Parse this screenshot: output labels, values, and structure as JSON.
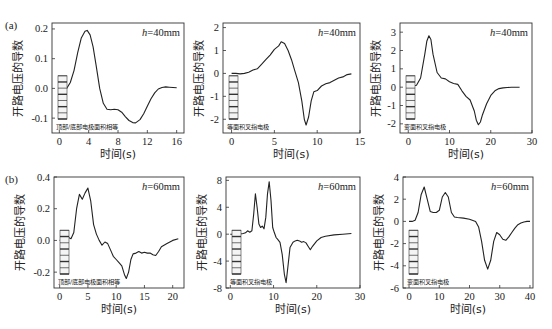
{
  "figure": {
    "row_labels": [
      "(a)",
      "(b)"
    ],
    "ylabel": "开路电压的导数",
    "xlabel": "时间(s)",
    "line_color": "#222222",
    "axis_color": "#333333"
  },
  "chart_data": [
    {
      "type": "line",
      "row": "(a)",
      "annotation": "h=40mm",
      "inset_label": "顶部/底部电极面积相等",
      "xlabel": "时间(s)",
      "ylabel": "开路电压的导数",
      "xlim": [
        -1,
        17
      ],
      "ylim": [
        -0.15,
        0.22
      ],
      "xticks": [
        0,
        4,
        8,
        12,
        16
      ],
      "yticks": [
        -0.1,
        0.0,
        0.1,
        0.2
      ],
      "ytick_labels": [
        "-0.1",
        "0.0",
        "0.1",
        "0.2"
      ],
      "box": [
        52,
        23,
        184,
        133
      ],
      "x": [
        0,
        0.5,
        1,
        1.5,
        2,
        2.5,
        3,
        3.5,
        3.8,
        4.2,
        4.6,
        5,
        5.5,
        6,
        6.5,
        7,
        7.5,
        8,
        8.5,
        9,
        9.5,
        10,
        10.4,
        11,
        11.5,
        12,
        12.5,
        13,
        13.5,
        14,
        14.5,
        15,
        15.5,
        16
      ],
      "y": [
        -0.005,
        -0.005,
        0.0,
        0.02,
        0.06,
        0.12,
        0.17,
        0.192,
        0.195,
        0.18,
        0.14,
        0.08,
        0.0,
        -0.05,
        -0.07,
        -0.072,
        -0.07,
        -0.072,
        -0.08,
        -0.095,
        -0.108,
        -0.115,
        -0.116,
        -0.105,
        -0.085,
        -0.06,
        -0.035,
        -0.015,
        -0.002,
        0.003,
        0.005,
        0.004,
        0.003,
        0.002
      ]
    },
    {
      "type": "line",
      "row": "(a)",
      "annotation": "h=40mm",
      "inset_label": "等面积叉指电极",
      "xlabel": "时间(s)",
      "ylabel": "开路电压的导数",
      "xlim": [
        -1,
        15
      ],
      "ylim": [
        -2.6,
        2.2
      ],
      "xticks": [
        0,
        5,
        10,
        15
      ],
      "yticks": [
        -2,
        -1,
        0,
        1,
        2
      ],
      "ytick_labels": [
        "-2",
        "-1",
        "0",
        "1",
        "2"
      ],
      "box": [
        223,
        23,
        360,
        133
      ],
      "x": [
        0,
        0.5,
        1,
        1.5,
        2,
        2.5,
        3,
        3.5,
        4,
        4.5,
        5,
        5.5,
        5.8,
        6.2,
        6.6,
        7,
        7.4,
        7.8,
        8.2,
        8.5,
        8.7,
        9,
        9.3,
        9.6,
        10,
        10.5,
        11,
        11.5,
        12,
        12.5,
        13,
        13.5,
        14
      ],
      "y": [
        0.0,
        0.0,
        -0.02,
        0.0,
        0.05,
        0.15,
        0.2,
        0.4,
        0.6,
        0.8,
        1.05,
        1.2,
        1.38,
        1.3,
        1.0,
        0.6,
        0.1,
        -0.4,
        -1.2,
        -2.0,
        -2.25,
        -1.9,
        -1.2,
        -0.8,
        -0.75,
        -0.55,
        -0.45,
        -0.4,
        -0.3,
        -0.2,
        -0.15,
        -0.05,
        -0.02
      ]
    },
    {
      "type": "line",
      "row": "(a)",
      "annotation": "h=40mm",
      "inset_label": "变面积叉指电极",
      "xlabel": "时间(s)",
      "ylabel": "开路电压的导数",
      "xlim": [
        -2,
        30
      ],
      "ylim": [
        -2.5,
        3.5
      ],
      "xticks": [
        0,
        10,
        20,
        30
      ],
      "yticks": [
        -2,
        -1,
        0,
        1,
        2,
        3
      ],
      "ytick_labels": [
        "-2",
        "-1",
        "0",
        "1",
        "2",
        "3"
      ],
      "box": [
        400,
        23,
        532,
        133
      ],
      "x": [
        0,
        1,
        2,
        3,
        4,
        4.5,
        5,
        5.5,
        6,
        7,
        8,
        9,
        10,
        11,
        12,
        13,
        14,
        15,
        16,
        16.5,
        17,
        17.5,
        18,
        19,
        20,
        21,
        22,
        23,
        24,
        25,
        26,
        27
      ],
      "y": [
        0.0,
        0.05,
        0.1,
        0.5,
        1.8,
        2.5,
        2.8,
        2.6,
        1.8,
        0.8,
        0.5,
        0.45,
        0.3,
        0.2,
        0.15,
        -0.2,
        -0.5,
        -0.7,
        -1.3,
        -1.8,
        -2.05,
        -1.9,
        -1.5,
        -0.9,
        -0.45,
        -0.2,
        -0.08,
        -0.04,
        -0.02,
        -0.01,
        0.0,
        0.0
      ]
    },
    {
      "type": "line",
      "row": "(b)",
      "annotation": "h=60mm",
      "inset_label": "顶部/底部电极面积相等",
      "xlabel": "时间(s)",
      "ylabel": "开路电压的导数",
      "xlim": [
        -1,
        22
      ],
      "ylim": [
        -0.3,
        0.4
      ],
      "xticks": [
        0,
        5,
        10,
        15,
        20
      ],
      "yticks": [
        -0.2,
        0.0,
        0.2,
        0.4
      ],
      "ytick_labels": [
        "-0.2",
        "0.0",
        "0.2",
        "0.4"
      ],
      "box": [
        54,
        177,
        184,
        288
      ],
      "x": [
        0,
        0.5,
        1,
        1.5,
        2,
        2.5,
        3,
        3.5,
        4,
        4.5,
        5,
        5.5,
        6,
        6.5,
        7,
        7.5,
        8,
        8.5,
        9,
        9.5,
        10,
        10.5,
        11,
        11.5,
        11.8,
        12.2,
        12.6,
        13,
        13.5,
        14,
        14.5,
        15,
        15.5,
        16,
        16.5,
        17,
        17.5,
        18,
        19,
        20,
        21
      ],
      "y": [
        0.0,
        0.0,
        0.01,
        0.02,
        0.01,
        0.05,
        0.2,
        0.29,
        0.26,
        0.3,
        0.33,
        0.25,
        0.1,
        0.04,
        0.0,
        -0.03,
        -0.01,
        -0.02,
        -0.06,
        -0.1,
        -0.12,
        -0.14,
        -0.16,
        -0.22,
        -0.24,
        -0.2,
        -0.12,
        -0.085,
        -0.08,
        -0.07,
        -0.08,
        -0.075,
        -0.08,
        -0.08,
        -0.09,
        -0.095,
        -0.07,
        -0.04,
        -0.02,
        0.0,
        0.01
      ]
    },
    {
      "type": "line",
      "row": "(b)",
      "annotation": "h=60mm",
      "inset_label": "等面积叉指电极",
      "xlabel": "时间(s)",
      "ylabel": "开路电压的导数",
      "xlim": [
        -1,
        30
      ],
      "ylim": [
        -8,
        8.5
      ],
      "xticks": [
        0,
        10,
        20,
        30
      ],
      "yticks": [
        -8,
        -4,
        0,
        4,
        8
      ],
      "ytick_labels": [
        "-8",
        "-4",
        "0",
        "4",
        "8"
      ],
      "box": [
        226,
        177,
        360,
        288
      ],
      "x": [
        0,
        1,
        2,
        3,
        3.5,
        4,
        4.5,
        5,
        5.4,
        5.8,
        6.2,
        6.6,
        7,
        7.4,
        7.8,
        8.2,
        8.6,
        9,
        9.4,
        9.8,
        10.2,
        10.6,
        11,
        11.5,
        12,
        12.5,
        12.9,
        13.3,
        13.8,
        14.5,
        15,
        15.5,
        16,
        16.5,
        17,
        17.5,
        18,
        18.5,
        19,
        20,
        21,
        22,
        24,
        26,
        28
      ],
      "y": [
        0.0,
        0.0,
        0.0,
        0.1,
        0.2,
        0.5,
        0.3,
        0.5,
        3.0,
        6.0,
        4.0,
        1.5,
        1.0,
        1.2,
        0.8,
        2.5,
        6.0,
        7.8,
        5.0,
        1.0,
        0.2,
        -0.5,
        -0.8,
        -1.2,
        -3.0,
        -6.0,
        -7.2,
        -5.0,
        -2.0,
        -1.2,
        -1.0,
        -0.9,
        -1.0,
        -1.2,
        -1.1,
        -1.3,
        -1.8,
        -2.3,
        -1.8,
        -1.0,
        -0.5,
        -0.3,
        -0.1,
        0.0,
        0.1
      ]
    },
    {
      "type": "line",
      "row": "(b)",
      "annotation": "h=60mm",
      "inset_label": "变面积叉指电极",
      "xlabel": "时间(s)",
      "ylabel": "开路电压的导数",
      "xlim": [
        -2,
        41
      ],
      "ylim": [
        -6,
        4
      ],
      "xticks": [
        0,
        10,
        20,
        30,
        40
      ],
      "yticks": [
        -6,
        -4,
        -2,
        0,
        2,
        4
      ],
      "ytick_labels": [
        "-6",
        "-4",
        "-2",
        "0",
        "2",
        "4"
      ],
      "box": [
        403,
        177,
        533,
        288
      ],
      "x": [
        0,
        1,
        2,
        3,
        4,
        5,
        6,
        7,
        8,
        9,
        10,
        11,
        12,
        13,
        14,
        15,
        16,
        18,
        20,
        22,
        23,
        24,
        25,
        26,
        27,
        28,
        29,
        30,
        31,
        32,
        33,
        34,
        35,
        36,
        37,
        38,
        39,
        40
      ],
      "y": [
        0.0,
        0.0,
        0.1,
        0.8,
        2.4,
        3.1,
        2.0,
        0.9,
        0.8,
        0.8,
        1.0,
        2.2,
        2.6,
        2.2,
        0.8,
        0.4,
        0.35,
        0.3,
        0.2,
        0.0,
        -0.5,
        -1.8,
        -3.5,
        -4.3,
        -3.5,
        -1.8,
        -1.0,
        -1.2,
        -1.6,
        -1.7,
        -1.4,
        -1.0,
        -0.6,
        -0.3,
        -0.15,
        -0.05,
        0.0,
        0.0
      ]
    }
  ]
}
